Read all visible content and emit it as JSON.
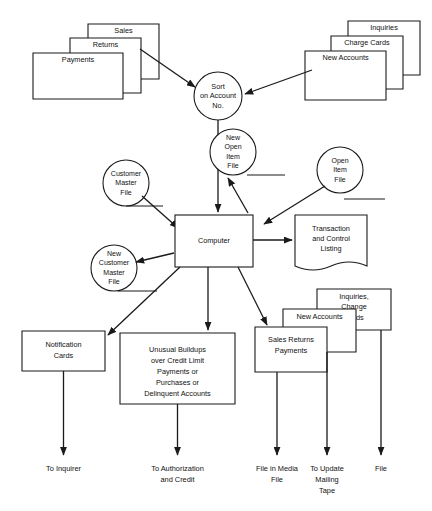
{
  "diagram": {
    "colors": {
      "stroke": "#1a1a1a",
      "fill": "#ffffff",
      "background": "#ffffff"
    },
    "input_stack_left": {
      "name": "sales-returns-payments-input-stack",
      "cards": [
        {
          "label": "Sales"
        },
        {
          "label": "Returns"
        },
        {
          "label": "Payments"
        }
      ]
    },
    "input_stack_right": {
      "name": "inquiries-charge-cards-new-accounts-input-stack",
      "cards": [
        {
          "label": "Inquiries"
        },
        {
          "label": "Charge Cards"
        },
        {
          "label": "New Accounts"
        }
      ]
    },
    "process_sort": {
      "lines": [
        "Sort",
        "on Account",
        "No."
      ]
    },
    "process_computer": {
      "label": "Computer"
    },
    "files": {
      "new_open_item": {
        "lines": [
          "New",
          "Open",
          "Item",
          "File"
        ]
      },
      "open_item": {
        "lines": [
          "Open",
          "Item",
          "File"
        ]
      },
      "customer_master": {
        "lines": [
          "Customer",
          "Master",
          "File"
        ]
      },
      "new_customer_master": {
        "lines": [
          "New",
          "Customer",
          "Master",
          "File"
        ]
      }
    },
    "outputs": {
      "transaction_listing": {
        "lines": [
          "Transaction",
          "and Control",
          "Listing"
        ]
      },
      "notification_cards": {
        "lines": [
          "Notification",
          "Cards"
        ]
      },
      "unusual_buildups": {
        "lines": [
          "Unusual Buildups",
          "over Credit Limit",
          "Payments or",
          "Purchases or",
          "Delinquent Accounts"
        ]
      }
    },
    "output_stack": {
      "name": "output-card-stack",
      "cards": [
        {
          "lines": [
            "Inquiries,",
            "Change",
            "Cards"
          ]
        },
        {
          "lines": [
            "New Accounts"
          ]
        },
        {
          "lines": [
            "Sales Returns",
            "Payments"
          ]
        }
      ]
    },
    "terminals": [
      {
        "lines": [
          "To Inquirer"
        ]
      },
      {
        "lines": [
          "To Authorization",
          "and Credit"
        ]
      },
      {
        "lines": [
          "File in Media",
          "File"
        ]
      },
      {
        "lines": [
          "To Update",
          "Mailing",
          "Tape"
        ]
      },
      {
        "lines": [
          "File"
        ]
      }
    ]
  }
}
